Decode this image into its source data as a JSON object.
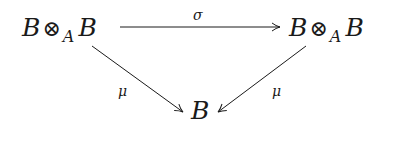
{
  "diagram": {
    "type": "commutative-triangle",
    "nodes": {
      "top_left": {
        "base": "B",
        "op": "⊗",
        "sub": "A",
        "base2": "B"
      },
      "top_right": {
        "base": "B",
        "op": "⊗",
        "sub": "A",
        "base2": "B"
      },
      "bottom": {
        "base": "B"
      }
    },
    "arrows": {
      "top": {
        "label": "σ",
        "from": "top_left",
        "to": "top_right"
      },
      "left": {
        "label": "μ",
        "from": "top_left",
        "to": "bottom"
      },
      "right": {
        "label": "μ",
        "from": "top_right",
        "to": "bottom"
      }
    },
    "colors": {
      "ink": "#1a1a1a",
      "background": "#ffffff"
    }
  }
}
